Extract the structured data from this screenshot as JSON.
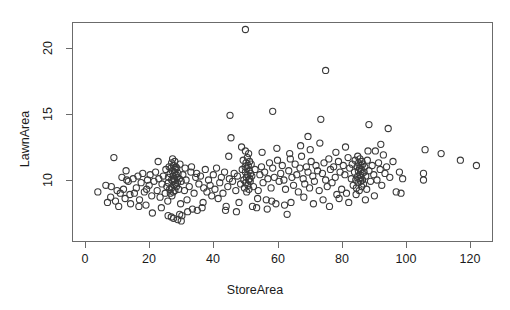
{
  "chart_data": {
    "type": "scatter",
    "title": "",
    "xlabel": "StoreArea",
    "ylabel": "LawnArea",
    "xlim": [
      -2.5,
      128
    ],
    "ylim": [
      6.2,
      22.1
    ],
    "xticks": [
      0,
      20,
      40,
      60,
      80,
      100,
      120
    ],
    "yticks": [
      10,
      15,
      20
    ],
    "xticklabels": [
      "0",
      "20",
      "40",
      "60",
      "80",
      "100",
      "120"
    ],
    "yticklabels": [
      "10",
      "15",
      "20"
    ],
    "grid": false,
    "legend": null,
    "marker": "open-circle",
    "marker_size": 3.1,
    "marker_color": "#3a3a3a",
    "n_points": 303,
    "points": [
      [
        4.0,
        9.1
      ],
      [
        6.5,
        9.6
      ],
      [
        7.0,
        8.3
      ],
      [
        8.2,
        9.5
      ],
      [
        9.0,
        11.7
      ],
      [
        9.5,
        8.4
      ],
      [
        10.0,
        9.2
      ],
      [
        10.5,
        8.0
      ],
      [
        11.0,
        9.0
      ],
      [
        11.5,
        10.2
      ],
      [
        12.0,
        9.3
      ],
      [
        12.5,
        8.6
      ],
      [
        13.0,
        10.0
      ],
      [
        13.5,
        9.9
      ],
      [
        14.0,
        8.9
      ],
      [
        14.2,
        8.2
      ],
      [
        15.0,
        10.1
      ],
      [
        15.4,
        9.0
      ],
      [
        16.0,
        9.4
      ],
      [
        16.5,
        10.3
      ],
      [
        17.0,
        8.5
      ],
      [
        17.5,
        9.8
      ],
      [
        18.0,
        10.5
      ],
      [
        18.5,
        9.1
      ],
      [
        19.0,
        8.1
      ],
      [
        19.5,
        10.0
      ],
      [
        20.0,
        9.6
      ],
      [
        20.3,
        10.4
      ],
      [
        20.8,
        8.8
      ],
      [
        21.0,
        7.5
      ],
      [
        21.5,
        9.9
      ],
      [
        22.0,
        10.6
      ],
      [
        22.5,
        9.2
      ],
      [
        23.0,
        10.1
      ],
      [
        23.4,
        8.7
      ],
      [
        24.0,
        9.7
      ],
      [
        24.4,
        10.3
      ],
      [
        25.0,
        9.0
      ],
      [
        25.2,
        10.8
      ],
      [
        25.5,
        9.5
      ],
      [
        25.8,
        8.4
      ],
      [
        26.0,
        10.2
      ],
      [
        26.0,
        9.8
      ],
      [
        26.2,
        11.0
      ],
      [
        26.4,
        9.3
      ],
      [
        26.5,
        10.5
      ],
      [
        26.6,
        9.0
      ],
      [
        26.8,
        10.9
      ],
      [
        27.0,
        11.3
      ],
      [
        27.0,
        10.0
      ],
      [
        27.0,
        9.4
      ],
      [
        27.1,
        8.8
      ],
      [
        27.2,
        10.7
      ],
      [
        27.3,
        11.6
      ],
      [
        27.4,
        9.9
      ],
      [
        27.5,
        10.3
      ],
      [
        27.5,
        9.1
      ],
      [
        27.6,
        11.1
      ],
      [
        27.7,
        10.1
      ],
      [
        27.8,
        9.6
      ],
      [
        27.9,
        10.6
      ],
      [
        28.0,
        11.4
      ],
      [
        28.0,
        10.0
      ],
      [
        28.0,
        9.2
      ],
      [
        28.1,
        10.8
      ],
      [
        28.2,
        9.7
      ],
      [
        28.3,
        11.0
      ],
      [
        28.4,
        10.4
      ],
      [
        28.5,
        9.5
      ],
      [
        28.6,
        10.9
      ],
      [
        28.7,
        10.2
      ],
      [
        28.8,
        9.8
      ],
      [
        29.0,
        10.5
      ],
      [
        29.2,
        9.3
      ],
      [
        29.4,
        10.1
      ],
      [
        29.6,
        11.2
      ],
      [
        30.0,
        9.9
      ],
      [
        30.5,
        10.4
      ],
      [
        31.0,
        9.2
      ],
      [
        31.5,
        10.0
      ],
      [
        32.0,
        7.6
      ],
      [
        32.5,
        9.5
      ],
      [
        33.0,
        10.6
      ],
      [
        33.5,
        7.8
      ],
      [
        34.0,
        9.0
      ],
      [
        34.5,
        10.2
      ],
      [
        35.0,
        7.7
      ],
      [
        35.5,
        9.7
      ],
      [
        36.0,
        10.3
      ],
      [
        36.5,
        7.9
      ],
      [
        37.0,
        9.4
      ],
      [
        37.5,
        10.8
      ],
      [
        38.0,
        9.1
      ],
      [
        38.5,
        10.0
      ],
      [
        39.0,
        9.6
      ],
      [
        40.0,
        10.4
      ],
      [
        40.5,
        9.3
      ],
      [
        41.0,
        10.9
      ],
      [
        41.5,
        8.6
      ],
      [
        42.0,
        9.8
      ],
      [
        42.5,
        10.2
      ],
      [
        43.0,
        9.0
      ],
      [
        43.5,
        10.6
      ],
      [
        44.0,
        8.0
      ],
      [
        44.5,
        9.5
      ],
      [
        45.0,
        10.1
      ],
      [
        45.5,
        13.2
      ],
      [
        46.0,
        9.9
      ],
      [
        46.5,
        10.5
      ],
      [
        47.0,
        9.2
      ],
      [
        47.5,
        10.3
      ],
      [
        48.0,
        8.3
      ],
      [
        48.5,
        9.7
      ],
      [
        49.0,
        10.8
      ],
      [
        49.3,
        11.5
      ],
      [
        49.5,
        10.0
      ],
      [
        49.7,
        9.4
      ],
      [
        49.9,
        11.0
      ],
      [
        50.0,
        21.4
      ],
      [
        50.0,
        12.2
      ],
      [
        50.0,
        10.6
      ],
      [
        50.1,
        9.8
      ],
      [
        50.2,
        11.3
      ],
      [
        50.3,
        10.2
      ],
      [
        50.4,
        9.1
      ],
      [
        50.5,
        10.9
      ],
      [
        50.6,
        11.7
      ],
      [
        50.7,
        10.4
      ],
      [
        50.8,
        9.6
      ],
      [
        50.9,
        11.1
      ],
      [
        51.0,
        10.0
      ],
      [
        51.0,
        12.0
      ],
      [
        51.1,
        9.3
      ],
      [
        51.2,
        10.7
      ],
      [
        51.3,
        11.4
      ],
      [
        51.4,
        10.1
      ],
      [
        51.5,
        9.9
      ],
      [
        51.6,
        10.5
      ],
      [
        51.8,
        11.2
      ],
      [
        52.0,
        10.3
      ],
      [
        52.5,
        9.5
      ],
      [
        53.0,
        10.8
      ],
      [
        53.5,
        7.9
      ],
      [
        54.0,
        9.2
      ],
      [
        54.5,
        10.4
      ],
      [
        55.0,
        11.0
      ],
      [
        55.5,
        9.8
      ],
      [
        56.0,
        10.6
      ],
      [
        56.5,
        8.5
      ],
      [
        57.0,
        10.1
      ],
      [
        57.5,
        11.3
      ],
      [
        58.0,
        9.4
      ],
      [
        58.5,
        10.9
      ],
      [
        59.0,
        10.2
      ],
      [
        59.5,
        8.2
      ],
      [
        60.0,
        11.5
      ],
      [
        60.5,
        9.9
      ],
      [
        61.0,
        10.5
      ],
      [
        61.5,
        11.1
      ],
      [
        62.0,
        10.0
      ],
      [
        62.5,
        9.3
      ],
      [
        63.0,
        7.4
      ],
      [
        63.5,
        10.7
      ],
      [
        64.0,
        11.6
      ],
      [
        64.5,
        10.2
      ],
      [
        65.0,
        9.6
      ],
      [
        65.5,
        11.2
      ],
      [
        66.0,
        10.4
      ],
      [
        66.5,
        9.1
      ],
      [
        67.0,
        10.9
      ],
      [
        67.5,
        11.8
      ],
      [
        68.0,
        10.1
      ],
      [
        68.5,
        9.7
      ],
      [
        69.0,
        11.0
      ],
      [
        69.5,
        10.6
      ],
      [
        70.0,
        9.4
      ],
      [
        70.5,
        11.4
      ],
      [
        71.0,
        10.3
      ],
      [
        71.5,
        9.9
      ],
      [
        72.0,
        11.1
      ],
      [
        72.5,
        10.7
      ],
      [
        73.0,
        9.2
      ],
      [
        73.5,
        14.6
      ],
      [
        74.0,
        10.5
      ],
      [
        74.5,
        11.3
      ],
      [
        75.0,
        18.3
      ],
      [
        75.0,
        10.0
      ],
      [
        75.5,
        9.5
      ],
      [
        76.0,
        11.6
      ],
      [
        76.5,
        10.8
      ],
      [
        77.0,
        9.8
      ],
      [
        77.5,
        11.0
      ],
      [
        78.0,
        10.2
      ],
      [
        78.5,
        8.9
      ],
      [
        79.0,
        11.4
      ],
      [
        79.5,
        10.6
      ],
      [
        80.0,
        9.3
      ],
      [
        80.5,
        11.1
      ],
      [
        81.0,
        10.4
      ],
      [
        81.5,
        9.0
      ],
      [
        82.0,
        11.7
      ],
      [
        82.5,
        10.9
      ],
      [
        83.0,
        10.1
      ],
      [
        83.3,
        11.2
      ],
      [
        83.6,
        9.6
      ],
      [
        84.0,
        10.6
      ],
      [
        84.2,
        11.5
      ],
      [
        84.4,
        10.0
      ],
      [
        84.6,
        9.4
      ],
      [
        84.8,
        11.0
      ],
      [
        85.0,
        10.3
      ],
      [
        85.0,
        11.8
      ],
      [
        85.1,
        9.8
      ],
      [
        85.2,
        10.7
      ],
      [
        85.3,
        11.3
      ],
      [
        85.4,
        10.1
      ],
      [
        85.5,
        9.2
      ],
      [
        85.6,
        10.9
      ],
      [
        85.7,
        11.6
      ],
      [
        85.8,
        10.4
      ],
      [
        85.9,
        9.9
      ],
      [
        86.0,
        11.1
      ],
      [
        86.0,
        10.2
      ],
      [
        86.1,
        10.8
      ],
      [
        86.2,
        9.5
      ],
      [
        86.3,
        11.4
      ],
      [
        86.4,
        10.5
      ],
      [
        86.5,
        10.0
      ],
      [
        86.6,
        11.2
      ],
      [
        86.8,
        9.7
      ],
      [
        87.0,
        10.6
      ],
      [
        87.2,
        11.0
      ],
      [
        87.5,
        10.3
      ],
      [
        87.8,
        9.3
      ],
      [
        88.0,
        11.5
      ],
      [
        88.5,
        10.7
      ],
      [
        89.0,
        9.9
      ],
      [
        89.5,
        11.1
      ],
      [
        90.0,
        10.4
      ],
      [
        90.5,
        12.2
      ],
      [
        91.0,
        10.0
      ],
      [
        91.5,
        11.3
      ],
      [
        92.0,
        10.8
      ],
      [
        92.5,
        9.6
      ],
      [
        93.0,
        11.9
      ],
      [
        93.5,
        10.5
      ],
      [
        94.0,
        11.0
      ],
      [
        95.0,
        10.2
      ],
      [
        96.0,
        11.4
      ],
      [
        97.0,
        9.1
      ],
      [
        98.0,
        10.6
      ],
      [
        98.5,
        9.0
      ],
      [
        99.0,
        10.1
      ],
      [
        105.5,
        10.5
      ],
      [
        105.5,
        10.0
      ],
      [
        106.0,
        12.3
      ],
      [
        111.0,
        12.0
      ],
      [
        117.0,
        11.5
      ],
      [
        122.0,
        11.1
      ],
      [
        8.0,
        8.7
      ],
      [
        12.8,
        10.7
      ],
      [
        16.8,
        8.0
      ],
      [
        19.2,
        9.3
      ],
      [
        23.8,
        7.9
      ],
      [
        29.8,
        8.2
      ],
      [
        30.2,
        7.3
      ],
      [
        31.8,
        8.5
      ],
      [
        36.8,
        8.3
      ],
      [
        39.5,
        8.8
      ],
      [
        43.8,
        7.7
      ],
      [
        47.2,
        7.6
      ],
      [
        52.2,
        8.0
      ],
      [
        53.8,
        8.6
      ],
      [
        56.8,
        7.8
      ],
      [
        58.2,
        8.4
      ],
      [
        62.2,
        8.1
      ],
      [
        64.2,
        8.3
      ],
      [
        68.2,
        8.7
      ],
      [
        71.2,
        8.2
      ],
      [
        74.2,
        8.5
      ],
      [
        76.2,
        8.0
      ],
      [
        79.2,
        8.6
      ],
      [
        82.2,
        8.3
      ],
      [
        84.5,
        8.9
      ],
      [
        87.4,
        8.5
      ],
      [
        90.2,
        8.8
      ],
      [
        22.8,
        11.4
      ],
      [
        33.2,
        11.0
      ],
      [
        44.8,
        11.8
      ],
      [
        48.8,
        12.5
      ],
      [
        55.2,
        12.1
      ],
      [
        59.8,
        12.4
      ],
      [
        63.8,
        12.0
      ],
      [
        67.2,
        12.6
      ],
      [
        70.2,
        12.3
      ],
      [
        73.2,
        12.8
      ],
      [
        78.2,
        12.1
      ],
      [
        81.2,
        12.5
      ],
      [
        88.2,
        12.2
      ],
      [
        92.2,
        12.7
      ],
      [
        45.2,
        14.9
      ],
      [
        58.5,
        15.2
      ],
      [
        88.5,
        14.2
      ],
      [
        94.5,
        13.9
      ],
      [
        69.5,
        13.3
      ],
      [
        31.2,
        10.9
      ],
      [
        34.8,
        10.5
      ],
      [
        26.9,
        7.2
      ],
      [
        28.9,
        7.0
      ],
      [
        30.0,
        6.9
      ],
      [
        29.5,
        7.4
      ],
      [
        27.6,
        7.1
      ],
      [
        25.9,
        7.3
      ]
    ]
  },
  "figure": {
    "axis_color": "#6b6b6b",
    "text_color": "#1a1a1a",
    "background": "#ffffff"
  }
}
